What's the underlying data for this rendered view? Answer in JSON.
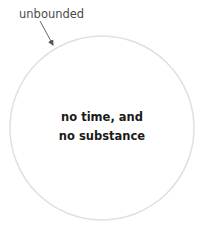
{
  "diagram": {
    "top_cut_text": [
      "",
      ""
    ],
    "label": "unbounded",
    "circle": {
      "cx": 102,
      "cy": 128,
      "r": 92,
      "stroke": "#e2e2e2",
      "fill": "#ffffff"
    },
    "arrow": {
      "x1": 40,
      "y1": 21,
      "x2": 53,
      "y2": 45,
      "color": "#555555"
    },
    "center_text": {
      "line1": "no time, and",
      "line2": "no substance"
    }
  }
}
